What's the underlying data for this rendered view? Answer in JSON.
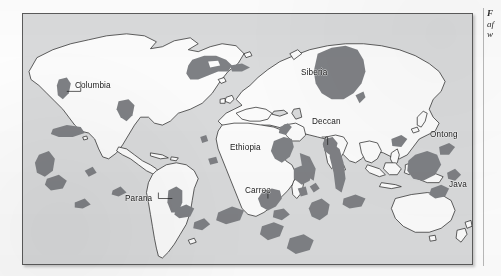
{
  "figure": {
    "kind": "world-map",
    "colors": {
      "ocean": "#d9dadb",
      "land": "#fbfbfb",
      "province": "#7e8084",
      "coastline": "#2b2b2b",
      "frame": "#5b5b5b",
      "page": "#fdfdfd",
      "label_text": "#1a1a1a"
    },
    "labels": [
      {
        "id": "columbia",
        "text": "Columbia",
        "x": 74,
        "y": 72,
        "leader": true
      },
      {
        "id": "siberia",
        "text": "Siberia",
        "x": 300,
        "y": 68,
        "leader": false
      },
      {
        "id": "deccan",
        "text": "Deccan",
        "x": 311,
        "y": 117,
        "leader": true
      },
      {
        "id": "ethiopia",
        "text": "Ethiopia",
        "x": 229,
        "y": 143,
        "leader": false
      },
      {
        "id": "carroo",
        "text": "Carroo",
        "x": 244,
        "y": 186,
        "leader": true
      },
      {
        "id": "parana",
        "text": "Parana",
        "x": 124,
        "y": 194,
        "leader": true
      },
      {
        "id": "ontong",
        "text": "Ontong",
        "x": 429,
        "y": 130,
        "leader": false
      },
      {
        "id": "java",
        "text": "Java",
        "x": 448,
        "y": 180,
        "leader": false
      }
    ]
  },
  "caption": {
    "clipped": true,
    "lines": [
      {
        "text": "F",
        "style": "bold-italic"
      },
      {
        "text": "af",
        "style": "italic"
      },
      {
        "text": "w",
        "style": "italic"
      }
    ]
  }
}
